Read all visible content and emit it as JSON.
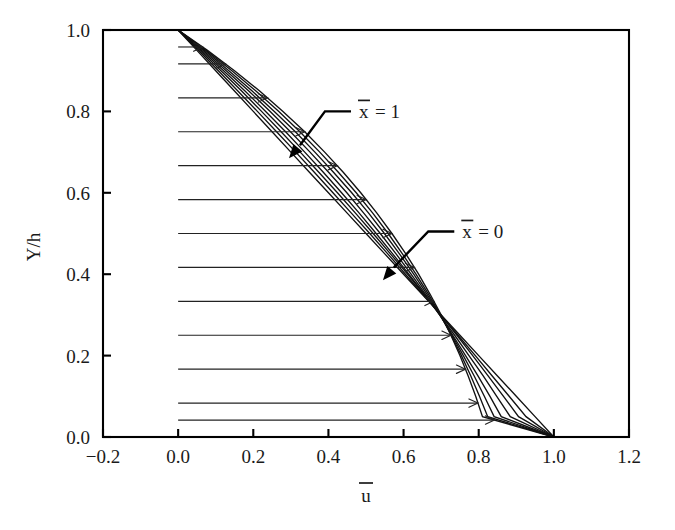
{
  "chart_data": {
    "type": "line",
    "title": "",
    "xlabel": "ū",
    "ylabel": "Y/h",
    "xlabel_base": "u",
    "ylabel_text": "Y/h",
    "xlim": [
      -0.2,
      1.2
    ],
    "ylim": [
      0.0,
      1.0
    ],
    "xticks": [
      -0.2,
      0.0,
      0.2,
      0.4,
      0.6,
      0.8,
      1.0,
      1.2
    ],
    "xticklabels": [
      "−0.2",
      "0.0",
      "0.2",
      "0.4",
      "0.6",
      "0.8",
      "1.0",
      "1.2"
    ],
    "yticks": [
      0.0,
      0.2,
      0.4,
      0.6,
      0.8,
      1.0
    ],
    "yticklabels": [
      "0.0",
      "0.2",
      "0.4",
      "0.6",
      "0.8",
      "1.0"
    ],
    "grid": false,
    "legend_position": "none",
    "curve_color": "#111111",
    "axis_color": "#000000",
    "series": [
      {
        "name": "x̄ = 0.00",
        "xbar": 0.0,
        "x": [
          0.0,
          0.05,
          0.1,
          0.15,
          0.2,
          0.25,
          0.3,
          0.35,
          0.4,
          0.45,
          0.5,
          0.55,
          0.6,
          0.65,
          0.7,
          0.75,
          0.8,
          0.85,
          0.9,
          0.95,
          1.0
        ],
        "y": [
          1.0,
          0.95,
          0.9,
          0.85,
          0.8,
          0.75,
          0.7,
          0.65,
          0.6,
          0.55,
          0.5,
          0.45,
          0.4,
          0.35,
          0.3,
          0.25,
          0.2,
          0.15,
          0.1,
          0.05,
          0.0
        ]
      },
      {
        "name": "x̄ = 0.14",
        "xbar": 0.1429,
        "x": [
          0.0,
          0.054,
          0.107,
          0.159,
          0.211,
          0.262,
          0.313,
          0.363,
          0.412,
          0.461,
          0.51,
          0.558,
          0.605,
          0.652,
          0.699,
          0.745,
          0.791,
          0.836,
          0.881,
          0.926,
          1.0
        ],
        "y": [
          1.0,
          0.95,
          0.9,
          0.85,
          0.8,
          0.75,
          0.7,
          0.65,
          0.6,
          0.55,
          0.5,
          0.45,
          0.4,
          0.35,
          0.3,
          0.25,
          0.2,
          0.15,
          0.1,
          0.05,
          0.0
        ]
      },
      {
        "name": "x̄ = 0.29",
        "xbar": 0.2857,
        "x": [
          0.0,
          0.058,
          0.114,
          0.169,
          0.222,
          0.274,
          0.325,
          0.375,
          0.424,
          0.472,
          0.519,
          0.565,
          0.611,
          0.655,
          0.699,
          0.742,
          0.784,
          0.825,
          0.866,
          0.906,
          1.0
        ],
        "y": [
          1.0,
          0.95,
          0.9,
          0.85,
          0.8,
          0.75,
          0.7,
          0.65,
          0.6,
          0.55,
          0.5,
          0.45,
          0.4,
          0.35,
          0.3,
          0.25,
          0.2,
          0.15,
          0.1,
          0.05,
          0.0
        ]
      },
      {
        "name": "x̄ = 0.43",
        "xbar": 0.4286,
        "x": [
          0.0,
          0.062,
          0.121,
          0.178,
          0.233,
          0.286,
          0.337,
          0.387,
          0.435,
          0.482,
          0.527,
          0.571,
          0.614,
          0.656,
          0.696,
          0.736,
          0.774,
          0.812,
          0.848,
          0.884,
          1.0
        ],
        "y": [
          1.0,
          0.95,
          0.9,
          0.85,
          0.8,
          0.75,
          0.7,
          0.65,
          0.6,
          0.55,
          0.5,
          0.45,
          0.4,
          0.35,
          0.3,
          0.25,
          0.2,
          0.15,
          0.1,
          0.05,
          0.0
        ]
      },
      {
        "name": "x̄ = 0.57",
        "xbar": 0.5714,
        "x": [
          0.0,
          0.066,
          0.128,
          0.188,
          0.245,
          0.299,
          0.351,
          0.401,
          0.449,
          0.494,
          0.538,
          0.58,
          0.62,
          0.659,
          0.696,
          0.731,
          0.765,
          0.798,
          0.83,
          0.86,
          1.0
        ],
        "y": [
          1.0,
          0.95,
          0.9,
          0.85,
          0.8,
          0.75,
          0.7,
          0.65,
          0.6,
          0.55,
          0.5,
          0.45,
          0.4,
          0.35,
          0.3,
          0.25,
          0.2,
          0.15,
          0.1,
          0.05,
          0.0
        ]
      },
      {
        "name": "x̄ = 0.71",
        "xbar": 0.7143,
        "x": [
          0.0,
          0.07,
          0.135,
          0.197,
          0.256,
          0.312,
          0.364,
          0.414,
          0.462,
          0.507,
          0.549,
          0.589,
          0.627,
          0.663,
          0.697,
          0.729,
          0.759,
          0.788,
          0.815,
          0.841,
          1.0
        ],
        "y": [
          1.0,
          0.95,
          0.9,
          0.85,
          0.8,
          0.75,
          0.7,
          0.65,
          0.6,
          0.55,
          0.5,
          0.45,
          0.4,
          0.35,
          0.3,
          0.25,
          0.2,
          0.15,
          0.1,
          0.05,
          0.0
        ]
      },
      {
        "name": "x̄ = 0.86",
        "xbar": 0.8571,
        "x": [
          0.0,
          0.074,
          0.143,
          0.207,
          0.268,
          0.324,
          0.377,
          0.427,
          0.474,
          0.518,
          0.559,
          0.597,
          0.633,
          0.667,
          0.698,
          0.727,
          0.754,
          0.779,
          0.802,
          0.824,
          1.0
        ],
        "y": [
          1.0,
          0.95,
          0.9,
          0.85,
          0.8,
          0.75,
          0.7,
          0.65,
          0.6,
          0.55,
          0.5,
          0.45,
          0.4,
          0.35,
          0.3,
          0.25,
          0.2,
          0.15,
          0.1,
          0.05,
          0.0
        ]
      },
      {
        "name": "x̄ = 1.00",
        "xbar": 1.0,
        "x": [
          0.0,
          0.078,
          0.15,
          0.217,
          0.279,
          0.337,
          0.39,
          0.44,
          0.486,
          0.529,
          0.569,
          0.606,
          0.64,
          0.671,
          0.7,
          0.726,
          0.75,
          0.772,
          0.792,
          0.81,
          1.0
        ],
        "y": [
          1.0,
          0.95,
          0.9,
          0.85,
          0.8,
          0.75,
          0.7,
          0.65,
          0.6,
          0.55,
          0.5,
          0.45,
          0.4,
          0.35,
          0.3,
          0.25,
          0.2,
          0.15,
          0.1,
          0.05,
          0.0
        ]
      }
    ],
    "arrows": {
      "count": 13,
      "description": "Horizontal velocity vectors drawn at u=0 extending to the x-bar=1 profile",
      "y_values": [
        0.9166,
        0.8333,
        0.75,
        0.6666,
        0.5833,
        0.5,
        0.4166,
        0.3333,
        0.25,
        0.1666,
        0.0833,
        0.0416,
        0.9583
      ],
      "base_x": 0.0
    },
    "annotations": [
      {
        "id": "xbar-1",
        "symbol": "x",
        "overbar": true,
        "text": "x̄ = 1",
        "equals_value": "1",
        "label_x": 0.46,
        "label_y": 0.8,
        "tip_x": 0.295,
        "tip_y": 0.685
      },
      {
        "id": "xbar-0",
        "symbol": "x",
        "overbar": true,
        "text": "x̄ = 0",
        "equals_value": "0",
        "label_x": 0.735,
        "label_y": 0.505,
        "tip_x": 0.545,
        "tip_y": 0.385
      }
    ]
  },
  "figure": {
    "background": "#ffffff",
    "plot_left_px": 103,
    "plot_top_px": 30,
    "plot_right_px": 629,
    "plot_bottom_px": 437
  }
}
